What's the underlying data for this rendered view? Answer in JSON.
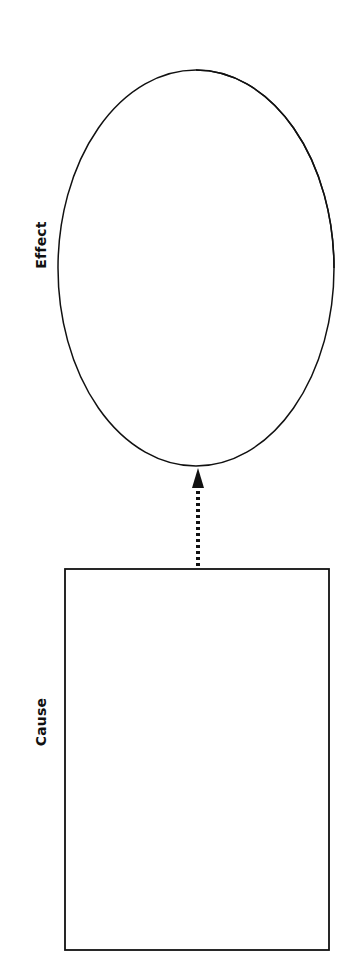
{
  "diagram": {
    "type": "cause-and-effect",
    "orientation": "rotated-90-ccw",
    "effect": {
      "label": "Effect",
      "shape": "ellipse"
    },
    "cause": {
      "label": "Cause",
      "shape": "rectangle"
    },
    "connector": {
      "style": "dotted-arrow",
      "direction": "cause-to-effect"
    },
    "colors": {
      "stroke": "#111111",
      "background": "#ffffff"
    }
  }
}
